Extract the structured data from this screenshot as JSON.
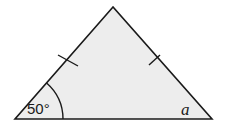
{
  "diagram": {
    "type": "isosceles-triangle",
    "colors": {
      "fill": "#ededed",
      "stroke": "#1a1a1a",
      "text": "#1a1a1a"
    },
    "vertices": {
      "apex": [
        113,
        7
      ],
      "bottom_left": [
        15,
        119
      ],
      "bottom_right": [
        212,
        119
      ]
    },
    "equal_side_marks": 2,
    "angles": [
      {
        "vertex": "bottom_left",
        "label": "50°",
        "marked_with_arc": true
      },
      {
        "vertex": "bottom_right",
        "label": "a",
        "marked_with_arc": false
      }
    ]
  }
}
